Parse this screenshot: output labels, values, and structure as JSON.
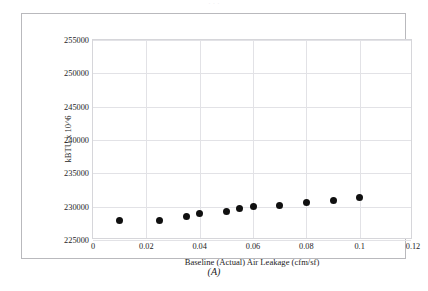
{
  "figure": {
    "top_clipped_text": "· · ·",
    "caption": "(A)"
  },
  "chart_data": {
    "type": "scatter",
    "title": "",
    "xlabel": "Baseline (Actual) Air Leakage (cfm/sf)",
    "ylabel": "kBTU x 10^6",
    "xlim": [
      0,
      0.12
    ],
    "ylim": [
      225000,
      255000
    ],
    "xticks": [
      0,
      0.02,
      0.04,
      0.06,
      0.08,
      0.1,
      0.12
    ],
    "xticklabels": [
      "0",
      "0.02",
      "0.04",
      "0.06",
      "0.08",
      "0.1",
      "0.12"
    ],
    "yticks": [
      225000,
      230000,
      235000,
      240000,
      245000,
      250000,
      255000
    ],
    "yticklabels": [
      "225000",
      "230000",
      "235000",
      "240000",
      "245000",
      "250000",
      "255000"
    ],
    "grid": true,
    "legend": null,
    "marker": {
      "shape": "circle",
      "color": "#101010",
      "size": 7
    },
    "x": [
      0.01,
      0.025,
      0.035,
      0.04,
      0.05,
      0.055,
      0.06,
      0.07,
      0.08,
      0.09,
      0.1
    ],
    "y": [
      227950,
      228000,
      228600,
      228950,
      229350,
      229750,
      230000,
      230200,
      230600,
      231000,
      231450
    ],
    "points": [
      {
        "x": 0.01,
        "y": 227950
      },
      {
        "x": 0.025,
        "y": 228000
      },
      {
        "x": 0.035,
        "y": 228600
      },
      {
        "x": 0.04,
        "y": 228950
      },
      {
        "x": 0.05,
        "y": 229350
      },
      {
        "x": 0.055,
        "y": 229750
      },
      {
        "x": 0.06,
        "y": 230000
      },
      {
        "x": 0.07,
        "y": 230200
      },
      {
        "x": 0.08,
        "y": 230600
      },
      {
        "x": 0.09,
        "y": 231000
      },
      {
        "x": 0.1,
        "y": 231450
      }
    ]
  }
}
